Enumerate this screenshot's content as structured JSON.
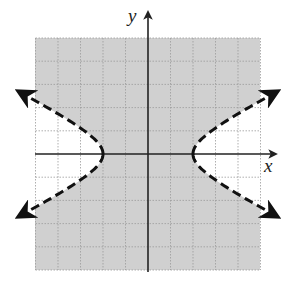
{
  "chart_data": {
    "type": "line",
    "title": "",
    "subtitle": "Graph of the inequality region bounded by a hyperbola",
    "xlabel": "x",
    "ylabel": "y",
    "xlim": [
      -5,
      5
    ],
    "ylim": [
      -5,
      5
    ],
    "grid": true,
    "grid_step": 1,
    "tick_labels": false,
    "legend": null,
    "series": [
      {
        "name": "hyperbola boundary",
        "equation": "x^2/4 - y^2 = 1",
        "style": "dashed",
        "color": "#111111",
        "branches": [
          {
            "name": "left branch",
            "vertex": [
              -2,
              0
            ],
            "points": [
              [
                -5.8,
                2.7
              ],
              [
                -4.5,
                2.0
              ],
              [
                -3.6,
                1.5
              ],
              [
                -2.8,
                1.0
              ],
              [
                -2.2,
                0.45
              ],
              [
                -2,
                0
              ],
              [
                -2.2,
                -0.45
              ],
              [
                -2.8,
                -1.0
              ],
              [
                -3.6,
                -1.5
              ],
              [
                -4.5,
                -2.0
              ],
              [
                -5.8,
                -2.7
              ]
            ],
            "arrows": [
              "upper-left",
              "lower-left"
            ]
          },
          {
            "name": "right branch",
            "vertex": [
              2,
              0
            ],
            "points": [
              [
                5.8,
                2.7
              ],
              [
                4.5,
                2.0
              ],
              [
                3.6,
                1.5
              ],
              [
                2.8,
                1.0
              ],
              [
                2.2,
                0.45
              ],
              [
                2,
                0
              ],
              [
                2.2,
                -0.45
              ],
              [
                2.8,
                -1.0
              ],
              [
                3.6,
                -1.5
              ],
              [
                4.5,
                -2.0
              ],
              [
                5.8,
                -2.7
              ]
            ],
            "arrows": [
              "upper-right",
              "lower-right"
            ]
          }
        ]
      }
    ],
    "shaded_region": {
      "description": "region between the two branches (containing the origin)",
      "inequality": "x^2/4 - y^2 < 1",
      "color": "#d0d0d0"
    },
    "asymptotes": [
      "y = x/2",
      "y = -x/2"
    ],
    "colors": {
      "shade": "#d0d0d0",
      "grid": "#9a9a9a",
      "axis": "#222222",
      "curve": "#111111",
      "background": "#ffffff"
    }
  },
  "axes": {
    "x_label": "x",
    "y_label": "y"
  }
}
